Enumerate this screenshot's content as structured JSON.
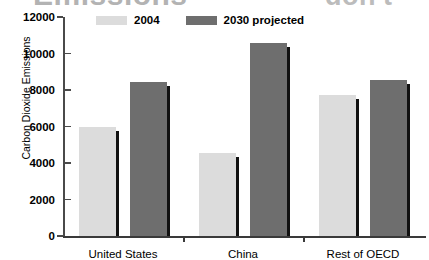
{
  "overlay_text": {
    "headline_left": "Emissions",
    "headline_right": "don't"
  },
  "chart_data": {
    "type": "bar",
    "title": "Emissions",
    "xlabel": "",
    "ylabel": "Carbon Dioxide Emissions",
    "categories": [
      "United States",
      "China",
      "Rest of OECD"
    ],
    "series": [
      {
        "name": "2004",
        "color": "#dcdcdc",
        "values": [
          6000,
          4550,
          7700
        ]
      },
      {
        "name": "2030 projected",
        "color": "#6e6e6e",
        "values": [
          8450,
          10600,
          8550
        ]
      }
    ],
    "ylim": [
      0,
      12000
    ],
    "yticks": [
      0,
      2000,
      4000,
      6000,
      8000,
      10000,
      12000
    ],
    "ytick_labels": [
      "0",
      "2000",
      "4000",
      "6000",
      "8000",
      "10000",
      "12000"
    ],
    "grid": false,
    "legend_position": "top-left"
  },
  "legend": {
    "items": [
      {
        "label": "2004",
        "swatch": "light"
      },
      {
        "label": "2030 projected",
        "swatch": "dark"
      }
    ]
  }
}
